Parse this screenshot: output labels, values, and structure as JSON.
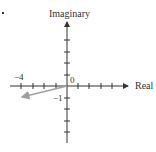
{
  "figure": {
    "marker": ".",
    "axes": {
      "x_label": "Real",
      "y_label": "Imaginary",
      "origin_label": "0",
      "x_tick_label": "−4",
      "y_tick_label": "−1"
    },
    "vector": {
      "re": -4,
      "im": -1,
      "color": "#a0a0a0"
    },
    "axis_color": "#333333"
  }
}
